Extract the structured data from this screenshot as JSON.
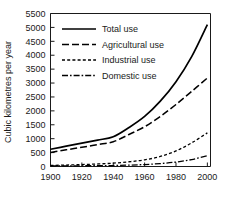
{
  "chart_data": {
    "type": "line",
    "title": "",
    "xlabel": "",
    "ylabel": "Cubic kilometres per year",
    "xlim": [
      1900,
      2002
    ],
    "ylim": [
      0,
      5500
    ],
    "ytick_step": 500,
    "xtick_step": 20,
    "grid": false,
    "legend_position": "upper-left-inside",
    "x": [
      1900,
      1910,
      1920,
      1930,
      1940,
      1950,
      1960,
      1970,
      1980,
      1990,
      2000
    ],
    "xticks": [
      "1900",
      "1920",
      "1940",
      "1960",
      "1980",
      "2000"
    ],
    "yticks": [
      "0",
      "500",
      "1000",
      "1500",
      "2000",
      "2500",
      "3000",
      "3500",
      "4000",
      "4500",
      "5000",
      "5500"
    ],
    "series": [
      {
        "name": "Total use",
        "style": "solid",
        "values": [
          620,
          730,
          840,
          950,
          1070,
          1400,
          1800,
          2350,
          3050,
          3950,
          5100
        ]
      },
      {
        "name": "Agricultural use",
        "style": "dashed",
        "values": [
          500,
          600,
          690,
          790,
          890,
          1150,
          1430,
          1800,
          2230,
          2700,
          3180
        ]
      },
      {
        "name": "Industrial use",
        "style": "dotted",
        "values": [
          40,
          50,
          70,
          90,
          120,
          170,
          240,
          360,
          560,
          850,
          1210
        ]
      },
      {
        "name": "Domestic use",
        "style": "dashdot",
        "values": [
          20,
          22,
          26,
          30,
          35,
          50,
          70,
          105,
          160,
          250,
          390
        ]
      }
    ]
  },
  "legend": {
    "items": [
      {
        "label": "Total use",
        "style": "solid"
      },
      {
        "label": "Agricultural use",
        "style": "dashed"
      },
      {
        "label": "Industrial use",
        "style": "dotted"
      },
      {
        "label": "Domestic use",
        "style": "dashdot"
      }
    ]
  },
  "colors": {
    "line": "#000000",
    "axis": "#1a1a1a",
    "background": "#ffffff"
  }
}
